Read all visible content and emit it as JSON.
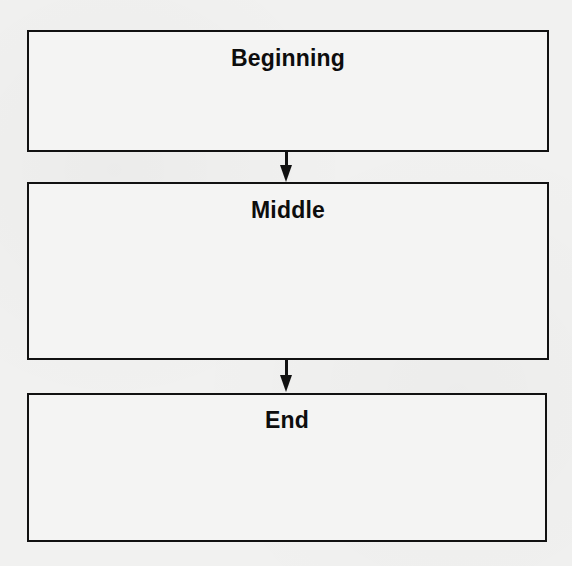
{
  "diagram": {
    "type": "flowchart",
    "direction": "top-to-bottom",
    "boxes": [
      {
        "id": "beginning",
        "label": "Beginning"
      },
      {
        "id": "middle",
        "label": "Middle"
      },
      {
        "id": "end",
        "label": "End"
      }
    ],
    "arrows": [
      {
        "from": "beginning",
        "to": "middle",
        "icon": "arrow-down-icon"
      },
      {
        "from": "middle",
        "to": "end",
        "icon": "arrow-down-icon"
      }
    ],
    "colors": {
      "line": "#111111",
      "text": "#0d0d0d",
      "background": "#f1f1f0"
    }
  }
}
